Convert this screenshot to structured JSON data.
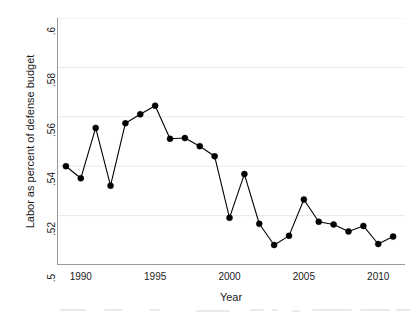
{
  "chart_data": {
    "type": "line",
    "title": "",
    "xlabel": "Year",
    "ylabel": "Labor as percent of defense budget",
    "xlim": [
      1988.4,
      2011.8
    ],
    "ylim": [
      0.5,
      0.6
    ],
    "grid": "horizontal",
    "legend": "none",
    "marker": "filled-circle",
    "line_color": "#000000",
    "marker_color": "#000000",
    "grid_color": "#e8e8ec",
    "axis_color": "#9a9a9a",
    "x": [
      1989,
      1990,
      1991,
      1992,
      1993,
      1994,
      1995,
      1996,
      1997,
      1998,
      1999,
      2000,
      2001,
      2002,
      2003,
      2004,
      2005,
      2006,
      2007,
      2008,
      2009,
      2010,
      2011
    ],
    "values": [
      0.54,
      0.5351,
      0.5555,
      0.5321,
      0.5574,
      0.561,
      0.5645,
      0.5511,
      0.5514,
      0.5481,
      0.544,
      0.5191,
      0.5368,
      0.5167,
      0.5081,
      0.5118,
      0.5265,
      0.5175,
      0.5164,
      0.5136,
      0.5158,
      0.5085,
      0.5115
    ],
    "xticks": [
      1990,
      1995,
      2000,
      2005,
      2010
    ],
    "xticklabels": [
      "1990",
      "1995",
      "2000",
      "2005",
      "2010"
    ],
    "yticks": [
      0.5,
      0.52,
      0.54,
      0.56,
      0.58,
      0.6
    ],
    "yticklabels": [
      ".5",
      ".52",
      ".54",
      ".56",
      ".58",
      ".6"
    ]
  },
  "axes": {
    "x_title": "Year",
    "y_title": "Labor as percent of defense budget"
  }
}
